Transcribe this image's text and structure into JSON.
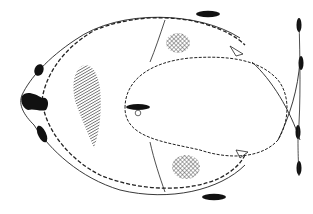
{
  "figure": {
    "type": "line-drawing",
    "colors": {
      "background": "#ffffff",
      "ink": "#1a1a1a",
      "hatch": "#333333"
    },
    "labels": []
  }
}
